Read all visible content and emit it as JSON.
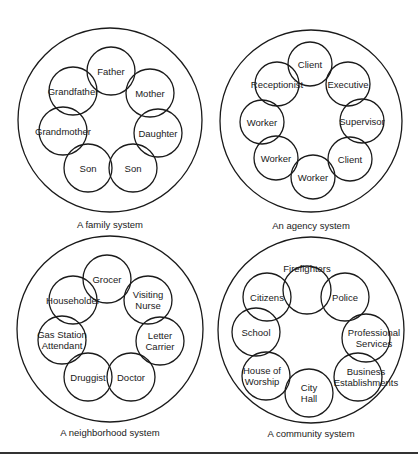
{
  "figure": {
    "panels": [
      {
        "id": "family",
        "caption": "A family system",
        "outer": {
          "cx": 110,
          "cy": 120,
          "r": 92
        },
        "caption_pos": {
          "x": 110,
          "y": 228
        },
        "members": [
          {
            "label": "Father",
            "cx": 111,
            "cy": 71,
            "r": 24,
            "lines": [
              "Father"
            ]
          },
          {
            "label": "Mother",
            "cx": 150,
            "cy": 93,
            "r": 24,
            "lines": [
              "Mother"
            ]
          },
          {
            "label": "Daughter",
            "cx": 158,
            "cy": 133,
            "r": 24,
            "lines": [
              "Daughter"
            ]
          },
          {
            "label": "Son",
            "cx": 133,
            "cy": 168,
            "r": 24,
            "lines": [
              "Son"
            ]
          },
          {
            "label": "Son",
            "cx": 88,
            "cy": 168,
            "r": 24,
            "lines": [
              "Son"
            ]
          },
          {
            "label": "Grandmother",
            "cx": 63,
            "cy": 131,
            "r": 24,
            "lines": [
              "Grandmother"
            ]
          },
          {
            "label": "Grandfather",
            "cx": 73,
            "cy": 91,
            "r": 24,
            "lines": [
              "Grandfather"
            ]
          }
        ]
      },
      {
        "id": "agency",
        "caption": "An agency system",
        "outer": {
          "cx": 311,
          "cy": 121,
          "r": 91
        },
        "caption_pos": {
          "x": 311,
          "y": 229
        },
        "members": [
          {
            "label": "Client",
            "cx": 310,
            "cy": 64,
            "r": 22,
            "lines": [
              "Client"
            ]
          },
          {
            "label": "Executive",
            "cx": 348,
            "cy": 84,
            "r": 22,
            "lines": [
              "Executive"
            ]
          },
          {
            "label": "Supervisor",
            "cx": 362,
            "cy": 121,
            "r": 22,
            "lines": [
              "Supervisor"
            ]
          },
          {
            "label": "Client",
            "cx": 350,
            "cy": 159,
            "r": 22,
            "lines": [
              "Client"
            ]
          },
          {
            "label": "Worker",
            "cx": 313,
            "cy": 177,
            "r": 22,
            "lines": [
              "Worker"
            ]
          },
          {
            "label": "Worker",
            "cx": 276,
            "cy": 158,
            "r": 22,
            "lines": [
              "Worker"
            ]
          },
          {
            "label": "Worker",
            "cx": 262,
            "cy": 122,
            "r": 22,
            "lines": [
              "Worker"
            ]
          },
          {
            "label": "Receptionist",
            "cx": 277,
            "cy": 84,
            "r": 22,
            "lines": [
              "Receptionist"
            ]
          }
        ]
      },
      {
        "id": "neighborhood",
        "caption": "A neighborhood system",
        "outer": {
          "cx": 110,
          "cy": 329,
          "r": 93
        },
        "caption_pos": {
          "x": 110,
          "y": 436
        },
        "members": [
          {
            "label": "Grocer",
            "cx": 107,
            "cy": 279,
            "r": 24,
            "lines": [
              "Grocer"
            ]
          },
          {
            "label": "Visiting Nurse",
            "cx": 148,
            "cy": 300,
            "r": 24,
            "lines": [
              "Visiting",
              "Nurse"
            ]
          },
          {
            "label": "Letter Carrier",
            "cx": 160,
            "cy": 341,
            "r": 24,
            "lines": [
              "Letter",
              "Carrier"
            ]
          },
          {
            "label": "Doctor",
            "cx": 131,
            "cy": 377,
            "r": 24,
            "lines": [
              "Doctor"
            ]
          },
          {
            "label": "Druggist",
            "cx": 88,
            "cy": 377,
            "r": 24,
            "lines": [
              "Druggist"
            ]
          },
          {
            "label": "Gas Station Attendant",
            "cx": 62,
            "cy": 340,
            "r": 24,
            "lines": [
              "Gas Station",
              "Attendant"
            ]
          },
          {
            "label": "Householder",
            "cx": 73,
            "cy": 300,
            "r": 24,
            "lines": [
              "Householder"
            ]
          }
        ]
      },
      {
        "id": "community",
        "caption": "A community system",
        "outer": {
          "cx": 311,
          "cy": 330,
          "r": 93
        },
        "caption_pos": {
          "x": 311,
          "y": 437
        },
        "members": [
          {
            "label": "Firefighters",
            "cx": 307,
            "cy": 290,
            "r": 24,
            "lines": [
              "Firefighters"
            ],
            "label_y": 268
          },
          {
            "label": "Police",
            "cx": 345,
            "cy": 297,
            "r": 24,
            "lines": [
              "Police"
            ]
          },
          {
            "label": "Professional Services",
            "cx": 366,
            "cy": 338,
            "r": 24,
            "lines": [
              "Professional",
              "Services"
            ],
            "label_x": 374
          },
          {
            "label": "Business Establishments",
            "cx": 358,
            "cy": 377,
            "r": 24,
            "lines": [
              "Business",
              "Establishments"
            ],
            "label_x": 366
          },
          {
            "label": "City Hall",
            "cx": 309,
            "cy": 393,
            "r": 24,
            "lines": [
              "City",
              "Hall"
            ]
          },
          {
            "label": "House of Worship",
            "cx": 266,
            "cy": 376,
            "r": 24,
            "lines": [
              "House of",
              "Worship"
            ],
            "label_x": 262
          },
          {
            "label": "School",
            "cx": 256,
            "cy": 332,
            "r": 24,
            "lines": [
              "School"
            ]
          },
          {
            "label": "Citizens",
            "cx": 267,
            "cy": 297,
            "r": 24,
            "lines": [
              "Citizens"
            ]
          }
        ]
      }
    ],
    "bottom_rule": {
      "y": 453
    }
  }
}
